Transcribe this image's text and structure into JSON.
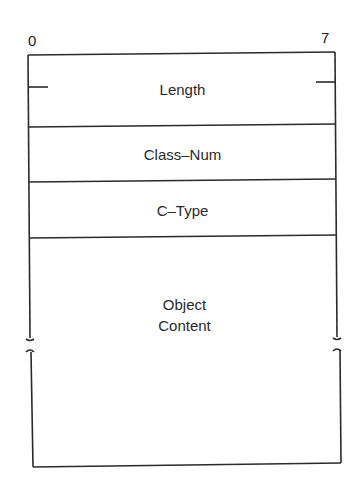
{
  "diagram": {
    "bit_labels": {
      "start": "0",
      "end": "7"
    },
    "fields": [
      {
        "label": "Length"
      },
      {
        "label": "Class–Num"
      },
      {
        "label": "C–Type"
      },
      {
        "label_line1": "Object",
        "label_line2": "Content"
      }
    ],
    "colors": {
      "line": "#2a2a2a",
      "background": "#ffffff"
    }
  }
}
